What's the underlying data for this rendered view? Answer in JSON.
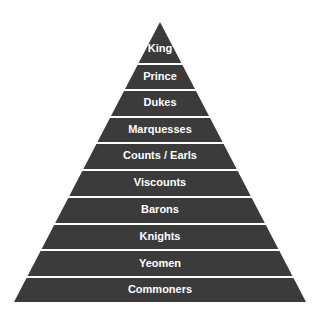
{
  "diagram": {
    "type": "pyramid",
    "fill_color": "#3b3b3b",
    "gap_color": "#ffffff",
    "levels": [
      {
        "label": "King"
      },
      {
        "label": "Prince"
      },
      {
        "label": "Dukes"
      },
      {
        "label": "Marquesses"
      },
      {
        "label": "Counts / Earls"
      },
      {
        "label": "Viscounts"
      },
      {
        "label": "Barons"
      },
      {
        "label": "Knights"
      },
      {
        "label": "Yeomen"
      },
      {
        "label": "Commoners"
      }
    ]
  }
}
